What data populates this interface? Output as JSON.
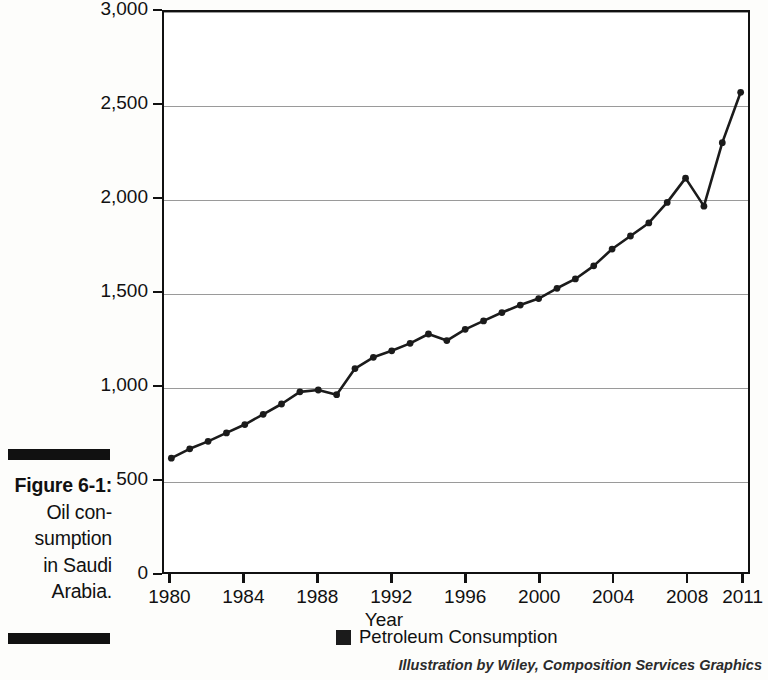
{
  "figure": {
    "label": "Figure 6-1:",
    "caption_lines": [
      "Oil con-",
      "sumption",
      "in Saudi",
      "Arabia."
    ],
    "credit": "Illustration by Wiley, Composition Services Graphics"
  },
  "legend": {
    "position": "bottom",
    "items": [
      {
        "label": "Petroleum Consumption",
        "color": "#1b1b1b",
        "marker": "square"
      }
    ]
  },
  "colors": {
    "line": "#1b1b1b",
    "marker": "#1b1b1b",
    "grid": "#9a9a9a",
    "frame": "#111111",
    "background": "#ffffff"
  },
  "chart_data": {
    "type": "line",
    "title": "",
    "subtitle": "",
    "xlabel": "Year",
    "ylabel": "",
    "xlim": [
      1979.6,
      2011.4
    ],
    "ylim": [
      0,
      3000
    ],
    "grid": true,
    "x_tick_labels": [
      "1980",
      "1984",
      "1988",
      "1992",
      "1996",
      "2000",
      "2004",
      "2008",
      "2011"
    ],
    "x_ticks": [
      1980,
      1984,
      1988,
      1992,
      1996,
      2000,
      2004,
      2008,
      2011
    ],
    "y_tick_labels": [
      "0",
      "500",
      "1,000",
      "1,500",
      "2,000",
      "2,500",
      "3,000"
    ],
    "y_ticks": [
      0,
      500,
      1000,
      1500,
      2000,
      2500,
      3000
    ],
    "series": [
      {
        "name": "Petroleum Consumption",
        "x": [
          1980,
          1981,
          1982,
          1983,
          1984,
          1985,
          1986,
          1987,
          1988,
          1989,
          1990,
          1991,
          1992,
          1993,
          1994,
          1995,
          1996,
          1997,
          1998,
          1999,
          2000,
          2001,
          2002,
          2003,
          2004,
          2005,
          2006,
          2007,
          2008,
          2009,
          2010,
          2011
        ],
        "values": [
          610,
          660,
          700,
          745,
          790,
          845,
          900,
          965,
          975,
          950,
          1090,
          1150,
          1185,
          1225,
          1275,
          1240,
          1300,
          1345,
          1390,
          1430,
          1465,
          1520,
          1570,
          1640,
          1730,
          1800,
          1870,
          1980,
          2110,
          1960,
          2300,
          2570
        ]
      }
    ]
  }
}
